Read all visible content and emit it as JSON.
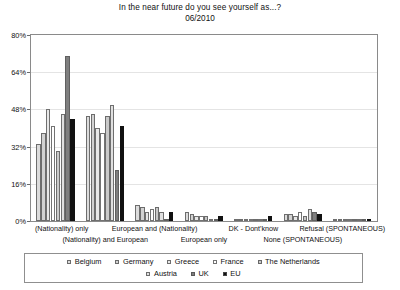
{
  "chart_data": {
    "type": "bar",
    "title": "In the near future do you see yourself as...?",
    "subtitle": "06/2010",
    "xlabel": "",
    "ylabel": "",
    "ylim": [
      0,
      80
    ],
    "yticks": [
      "0%",
      "16%",
      "32%",
      "48%",
      "64%",
      "80%"
    ],
    "ytick_values": [
      0,
      16,
      32,
      48,
      64,
      80
    ],
    "grid": true,
    "legend_position": "bottom",
    "categories": [
      "(Nationality) only",
      "(Nationality) and European",
      "European and (Nationality)",
      "European only",
      "DK - Dont'know",
      "None (SPONTANEOUS)",
      "Refusal (SPONTANEOUS)"
    ],
    "series": [
      {
        "name": "Belgium",
        "color": "#dcdcdc",
        "values": [
          33,
          45,
          7,
          4,
          1,
          3,
          0
        ]
      },
      {
        "name": "Germany",
        "color": "#d2d2d2",
        "values": [
          38,
          46,
          6,
          3,
          1,
          3,
          0
        ]
      },
      {
        "name": "Greece",
        "color": "#e8e8e8",
        "values": [
          48,
          40,
          4,
          2,
          1,
          2,
          1
        ]
      },
      {
        "name": "France",
        "color": "#ffffff",
        "values": [
          41,
          38,
          5,
          2,
          1,
          4,
          0
        ]
      },
      {
        "name": "The Netherlands",
        "color": "#c9c9c9",
        "values": [
          30,
          45,
          6,
          2,
          0,
          2,
          0
        ]
      },
      {
        "name": "Austria",
        "color": "#e0e0e0",
        "values": [
          46,
          50,
          4,
          1,
          1,
          5,
          0
        ]
      },
      {
        "name": "UK",
        "color": "#7f7f7f",
        "values": [
          71,
          22,
          1,
          1,
          0,
          4,
          0
        ]
      },
      {
        "name": "EU",
        "color": "#111111",
        "values": [
          44,
          41,
          4,
          2,
          2,
          3,
          0
        ]
      }
    ]
  },
  "legend": {
    "row1": [
      "Belgium",
      "Germany",
      "Greece",
      "France",
      "The Netherlands"
    ],
    "row2": [
      "Austria",
      "UK",
      "EU"
    ]
  }
}
